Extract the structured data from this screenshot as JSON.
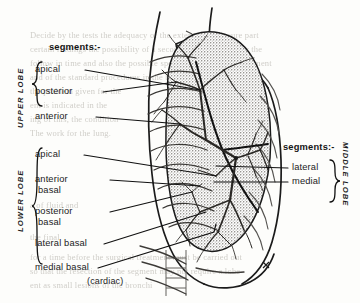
{
  "figure": {
    "view": "lateral chest radiograph tracing with bronchial tree",
    "colors": {
      "ink": "#1b1b1b",
      "lung_fill": "#b9b7b2",
      "paper": "#fdfdfb",
      "ghost": "#c8c6c0"
    }
  },
  "left_panel": {
    "header": "segments:-",
    "upper_lobe": {
      "name": "UPPER LOBE",
      "segments": [
        {
          "label": "apical"
        },
        {
          "label": "posterior"
        },
        {
          "label": "anterior"
        }
      ]
    },
    "lower_lobe": {
      "name": "LOWER LOBE",
      "segments": [
        {
          "label": "apical"
        },
        {
          "label": "anterior",
          "label2": "basal"
        },
        {
          "label": "posterior",
          "label2": "basal"
        },
        {
          "label": "lateral basal"
        },
        {
          "label": "medial basal",
          "label2": "(cardiac)"
        }
      ]
    }
  },
  "right_panel": {
    "header": "segments:-",
    "middle_lobe": {
      "name": "MIDDLE LOBE",
      "segments": [
        {
          "label": "lateral"
        },
        {
          "label": "medial"
        }
      ]
    }
  },
  "background_text": {
    "note": "faint show-through of printed text from the reverse of the page",
    "lines": [
      "Decide by the tests the adequacy of the extent and pressure part",
      "certain findings the possibility of a second severe lesion. For the",
      "follow in time and also the possible specific disease of the segment",
      "and of the standard procedures in the bronchial tree below the",
      "the problem given for the",
      "ent is indicated in the",
      "ing of this, the condition",
      "The work for the lung.",
      "a of fluid and",
      "the final",
      "for a time before the surgical treatment must be carried out",
      "so that the resection of the segment may not require a lobe",
      "ent as small lesions of the bronchi"
    ]
  }
}
